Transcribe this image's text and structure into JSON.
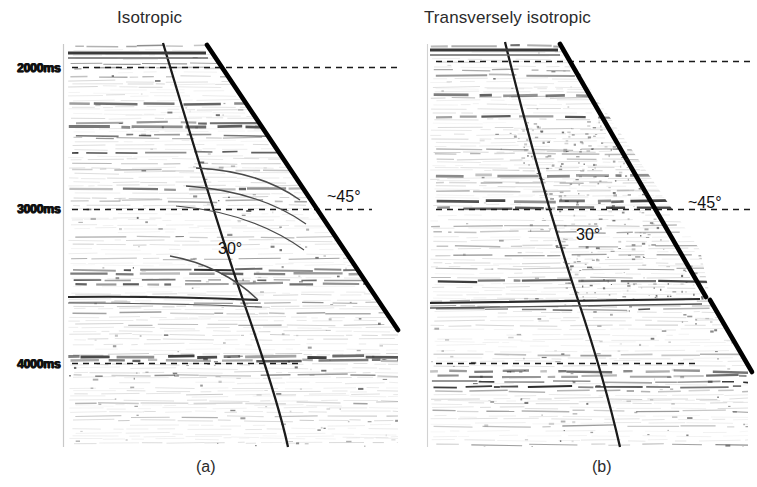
{
  "figure": {
    "kind": "seismic-migration-comparison",
    "background_color": "#ffffff",
    "ink_color": "#111111",
    "panels": [
      {
        "id": "a",
        "title": "Isotropic",
        "subcaption": "(a)",
        "annotations": [
          {
            "name": "dip-45",
            "text": "~45°"
          },
          {
            "name": "dip-30",
            "text": "30°"
          }
        ]
      },
      {
        "id": "b",
        "title": "Transversely isotropic",
        "subcaption": "(b)",
        "annotations": [
          {
            "name": "dip-45",
            "text": "~45°"
          },
          {
            "name": "dip-30",
            "text": "30°"
          }
        ]
      }
    ]
  },
  "time_axis": {
    "label_unit": "ms",
    "ticks": [
      {
        "value": 2000,
        "label": "2000ms"
      },
      {
        "value": 3000,
        "label": "3000ms"
      },
      {
        "value": 4000,
        "label": "4000ms"
      }
    ]
  },
  "chart_data": {
    "type": "heatmap",
    "xlabel": "",
    "ylabel": "Two-way traveltime",
    "ylim": [
      1850,
      4400
    ],
    "yunit": "ms",
    "grid": false,
    "legend": null,
    "panels": [
      {
        "name": "Isotropic",
        "subcaption": "(a)",
        "annotations": [
          {
            "label": "~45°",
            "value": 45,
            "unit": "deg",
            "feature": "steep-dip-boundary"
          },
          {
            "label": "30°",
            "value": 30,
            "unit": "deg",
            "feature": "fault-plane-dip"
          }
        ]
      },
      {
        "name": "Transversely isotropic",
        "subcaption": "(b)",
        "annotations": [
          {
            "label": "~45°",
            "value": 45,
            "unit": "deg",
            "feature": "steep-dip-boundary"
          },
          {
            "label": "30°",
            "value": 30,
            "unit": "deg",
            "feature": "fault-plane-dip"
          }
        ]
      }
    ],
    "y_ticks": [
      2000,
      3000,
      4000
    ],
    "y_tick_labels": [
      "2000ms",
      "3000ms",
      "4000ms"
    ]
  }
}
